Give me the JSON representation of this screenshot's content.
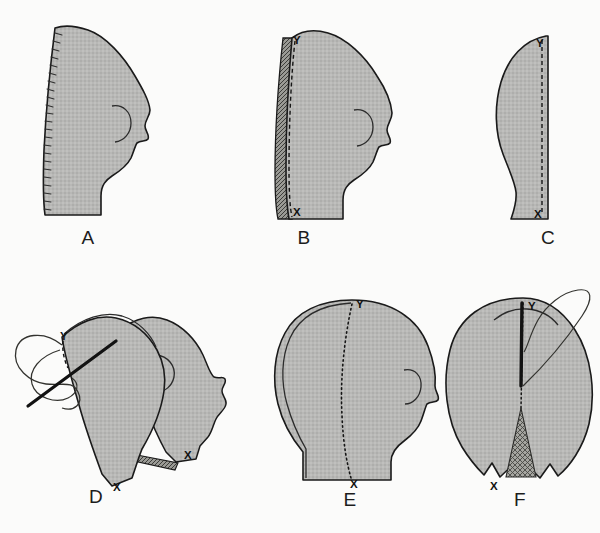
{
  "figure": {
    "background_color": "#fbfbfa",
    "fill_color": "#b6b6b4",
    "fill_color_dark": "#8f8f8c",
    "outline_color": "#1a1a1a",
    "page_width": 600,
    "page_height": 533,
    "faint_top_mark": "",
    "faint_bottom_caption": ""
  },
  "panels": [
    {
      "id": "A",
      "label": "A",
      "label_x": 88,
      "label_y": 244,
      "description": "Flat side-profile head pattern piece with notch ticks along back edge",
      "marks": []
    },
    {
      "id": "B",
      "label": "B",
      "label_x": 304,
      "label_y": 244,
      "description": "Two side pieces laid together, dashed stitching line along back edge with seam allowance",
      "marks": [
        {
          "text": "Y",
          "x": 293,
          "y": 44
        },
        {
          "text": "X",
          "x": 293,
          "y": 216
        }
      ]
    },
    {
      "id": "C",
      "label": "C",
      "label_x": 548,
      "label_y": 244,
      "description": "Center gusset pattern piece with dashed stitching line on straight edge",
      "marks": [
        {
          "text": "Y",
          "x": 542,
          "y": 46
        },
        {
          "text": "X",
          "x": 540,
          "y": 217
        }
      ]
    },
    {
      "id": "D",
      "label": "D",
      "label_x": 96,
      "label_y": 501,
      "description": "Side pieces being stitched together at Y with needle and looping thread",
      "marks": [
        {
          "text": "Y",
          "x": 60,
          "y": 340
        },
        {
          "text": "X",
          "x": 148,
          "y": 490
        },
        {
          "text": "X",
          "x": 188,
          "y": 455
        }
      ]
    },
    {
      "id": "E",
      "label": "E",
      "label_x": 350,
      "label_y": 503,
      "description": "Assembled head, three-quarter front view, dotted center seam from Y to X",
      "marks": [
        {
          "text": "Y",
          "x": 355,
          "y": 305
        },
        {
          "text": "X",
          "x": 352,
          "y": 484
        }
      ]
    },
    {
      "id": "F",
      "label": "F",
      "label_x": 520,
      "label_y": 503,
      "description": "Assembled head rear view, needle inserted along center back seam, hatched gusset at base",
      "marks": [
        {
          "text": "Y",
          "x": 527,
          "y": 306
        },
        {
          "text": "X",
          "x": 494,
          "y": 486
        }
      ]
    }
  ],
  "legend": {
    "mark_x": "X",
    "mark_y": "Y",
    "meaning": "X and Y denote matching seam registration points on each pattern piece"
  }
}
